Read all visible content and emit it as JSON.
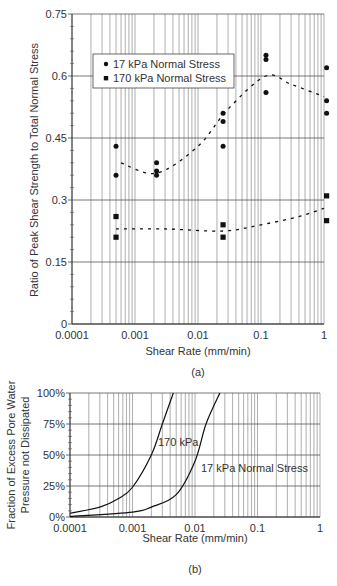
{
  "chart_data": [
    {
      "type": "scatter",
      "panel_label": "(a)",
      "title": "",
      "xlabel": "Shear Rate (mm/min)",
      "ylabel": "Ratio of Peak Shear Strength to Total Normal Stress",
      "xscale": "log",
      "xlim": [
        0.0001,
        1
      ],
      "ylim": [
        0,
        0.75
      ],
      "x_ticks": [
        "0.0001",
        "0.001",
        "0.01",
        "0.1",
        "1"
      ],
      "y_ticks": [
        "0",
        "0.15",
        "0.3",
        "0.45",
        "0.6",
        "0.75"
      ],
      "grid": true,
      "legend_position": "upper left (inside)",
      "series": [
        {
          "name": "17 kPa Normal Stress",
          "marker": "circle",
          "points": [
            [
              0.0005,
              0.43
            ],
            [
              0.0005,
              0.36
            ],
            [
              0.0022,
              0.39
            ],
            [
              0.0022,
              0.37
            ],
            [
              0.0022,
              0.36
            ],
            [
              0.025,
              0.51
            ],
            [
              0.025,
              0.49
            ],
            [
              0.025,
              0.43
            ],
            [
              0.12,
              0.65
            ],
            [
              0.12,
              0.64
            ],
            [
              0.12,
              0.56
            ],
            [
              1.1,
              0.62
            ],
            [
              1.1,
              0.54
            ],
            [
              1.1,
              0.51
            ]
          ],
          "trend": [
            [
              0.0006,
              0.39
            ],
            [
              0.0022,
              0.365
            ],
            [
              0.01,
              0.43
            ],
            [
              0.03,
              0.52
            ],
            [
              0.12,
              0.6
            ],
            [
              0.3,
              0.58
            ],
            [
              1.0,
              0.55
            ]
          ]
        },
        {
          "name": "170 kPa Normal Stress",
          "marker": "square",
          "points": [
            [
              0.0005,
              0.26
            ],
            [
              0.0005,
              0.21
            ],
            [
              0.025,
              0.24
            ],
            [
              0.025,
              0.21
            ],
            [
              1.1,
              0.31
            ],
            [
              1.1,
              0.25
            ]
          ],
          "trend": [
            [
              0.0005,
              0.23
            ],
            [
              0.003,
              0.23
            ],
            [
              0.025,
              0.225
            ],
            [
              0.1,
              0.24
            ],
            [
              0.4,
              0.26
            ],
            [
              1.0,
              0.28
            ]
          ]
        }
      ]
    },
    {
      "type": "line",
      "panel_label": "(b)",
      "title": "",
      "xlabel": "Shear Rate (mm/min)",
      "ylabel": "Fraction of Excess Pore Water Pressure not Dissipated",
      "xscale": "log",
      "xlim": [
        0.0001,
        1
      ],
      "ylim": [
        0,
        100
      ],
      "x_ticks": [
        "0.0001",
        "0.001",
        "0.01",
        "0.1",
        "1"
      ],
      "y_ticks": [
        "0%",
        "25%",
        "50%",
        "75%",
        "100%"
      ],
      "grid": true,
      "annotations": [
        "170 kPa",
        "17 kPa Normal Stress"
      ],
      "series": [
        {
          "name": "170 kPa",
          "points": [
            [
              0.0001,
              3
            ],
            [
              0.0003,
              8
            ],
            [
              0.0006,
              15
            ],
            [
              0.001,
              24
            ],
            [
              0.002,
              50
            ],
            [
              0.003,
              75
            ],
            [
              0.0045,
              100
            ]
          ]
        },
        {
          "name": "17 kPa Normal Stress",
          "points": [
            [
              0.0001,
              0.5
            ],
            [
              0.001,
              4
            ],
            [
              0.002,
              8
            ],
            [
              0.005,
              18
            ],
            [
              0.01,
              45
            ],
            [
              0.015,
              75
            ],
            [
              0.025,
              100
            ]
          ]
        }
      ]
    }
  ],
  "labels": {
    "a_xlabel": "Shear Rate (mm/min)",
    "a_ylabel": "Ratio of Peak Shear Strength to Total Normal Stress",
    "a_panel": "(a)",
    "legend_17": "17 kPa Normal Stress",
    "legend_170": "170 kPa Normal Stress",
    "b_xlabel": "Shear Rate (mm/min)",
    "b_ylabel_1": "Fraction of Excess Pore Water",
    "b_ylabel_2": "Pressure not Dissipated",
    "b_panel": "(b)",
    "b_ann_170": "170 kPa",
    "b_ann_17": "17 kPa Normal Stress"
  }
}
